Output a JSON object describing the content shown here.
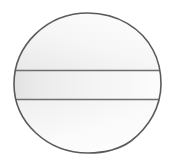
{
  "canvas": {
    "width": 172,
    "height": 163,
    "background_color": "#ffffff"
  },
  "figure": {
    "outline_color": "#5a5a5a",
    "outline_width": 1.6,
    "fill_top_color": "#f7f7f7",
    "fill_band_color": "#ededed",
    "fill_bottom_color": "#fbfbfb",
    "gradient_start_color": "#e4e4e4",
    "gradient_end_color": "#ffffff",
    "body_path": "M 88 13 C 118 13 142 29 153 50 C 159 61 161 70 161 84 C 161 107 149 127 131 141 C 117 151 102 153 88 153 C 47 153 14 122 14 84 C 14 45 47 13 88 13 Z",
    "bounds": {
      "left": 14,
      "right": 161,
      "top": 13,
      "bottom": 153
    }
  },
  "chords": {
    "upper": {
      "name": "upper-chord",
      "y": 70.5,
      "x_start": 15,
      "x_end": 161,
      "color": "#6e6e6e",
      "width": 1.4
    },
    "lower": {
      "name": "lower-chord",
      "y": 99.5,
      "x_start": 15,
      "x_end": 161,
      "color": "#6e6e6e",
      "width": 1.4
    }
  },
  "regions": [
    {
      "name": "top-cap",
      "label": ""
    },
    {
      "name": "middle-band",
      "label": ""
    },
    {
      "name": "bottom-cap",
      "label": ""
    }
  ]
}
